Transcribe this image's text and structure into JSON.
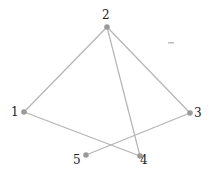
{
  "diagram": {
    "type": "graph",
    "edge_color": "#b4b4b4",
    "node_color": "#9a9a9a",
    "label_color": "#222222",
    "nodes": [
      {
        "id": "1",
        "label": "1",
        "x": 24,
        "y": 112,
        "lx": 11,
        "ly": 116
      },
      {
        "id": "2",
        "label": "2",
        "x": 107,
        "y": 27,
        "lx": 102,
        "ly": 19
      },
      {
        "id": "3",
        "label": "3",
        "x": 190,
        "y": 113,
        "lx": 194,
        "ly": 117
      },
      {
        "id": "4",
        "label": "4",
        "x": 140,
        "y": 156,
        "lx": 140,
        "ly": 164
      },
      {
        "id": "5",
        "label": "5",
        "x": 86,
        "y": 155,
        "lx": 73,
        "ly": 164
      }
    ],
    "edges": [
      {
        "from": "1",
        "to": "2"
      },
      {
        "from": "2",
        "to": "3"
      },
      {
        "from": "2",
        "to": "4"
      },
      {
        "from": "1",
        "to": "4"
      },
      {
        "from": "3",
        "to": "5"
      }
    ]
  }
}
